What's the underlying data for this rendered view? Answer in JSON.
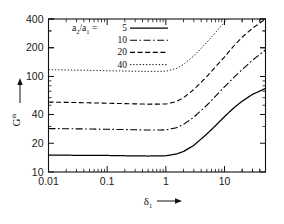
{
  "figure": {
    "background": "#ffffff",
    "line_color": "#000000"
  },
  "axes": {
    "x": {
      "label_main": "δ",
      "label_sub": "1",
      "arrow": "⟶",
      "scale": "log",
      "ticks": [
        "0.01",
        "0.1",
        "1",
        "10"
      ],
      "tick_values": [
        0.01,
        0.1,
        1,
        10
      ],
      "range": [
        0.01,
        50
      ]
    },
    "y": {
      "label_main": "G",
      "label_sup": "th",
      "arrow": "↑",
      "scale": "log",
      "ticks": [
        "400",
        "200",
        "100",
        "40",
        "20",
        "10"
      ],
      "tick_values": [
        400,
        200,
        100,
        40,
        20,
        10
      ],
      "range": [
        10,
        400
      ]
    }
  },
  "legend": {
    "title_num": "a",
    "title_num_sub": "2",
    "title_slash": "/",
    "title_den": "a",
    "title_den_sub": "1",
    "equals": "=",
    "entries": [
      {
        "label": "5",
        "style": "solid",
        "dash": "none"
      },
      {
        "label": "10",
        "style": "dash-dot",
        "dash": "7,2.5,1.6,2.5"
      },
      {
        "label": "20",
        "style": "dashed",
        "dash": "5,2.6"
      },
      {
        "label": "40",
        "style": "dotted",
        "dash": "1.3,1.9"
      }
    ]
  },
  "chart_data": {
    "type": "line",
    "title": "",
    "xlabel": "δ₁",
    "ylabel": "G^th",
    "xscale": "log",
    "yscale": "log",
    "xlim": [
      0.01,
      50
    ],
    "ylim": [
      10,
      400
    ],
    "grid": false,
    "legend_position": "top-left",
    "legend_title": "a₂/a₁",
    "x": [
      0.01,
      0.02,
      0.05,
      0.1,
      0.2,
      0.5,
      1,
      1.5,
      2,
      3,
      5,
      7,
      10,
      15,
      20,
      30,
      50
    ],
    "series": [
      {
        "name": "5",
        "style": "solid",
        "values": [
          15.0,
          15.0,
          14.9,
          14.9,
          14.8,
          14.7,
          14.8,
          15.4,
          16.4,
          19.0,
          25.0,
          30.5,
          38.0,
          48.0,
          55.0,
          65.0,
          75.0
        ]
      },
      {
        "name": "10",
        "style": "dash-dot",
        "values": [
          28.5,
          28.4,
          28.2,
          28.0,
          27.8,
          27.5,
          27.6,
          29.0,
          31.5,
          37.5,
          50.0,
          62.0,
          78.0,
          100.0,
          118.0,
          148.0,
          190.0
        ]
      },
      {
        "name": "20",
        "style": "dashed",
        "values": [
          54.0,
          53.6,
          53.0,
          52.5,
          52.0,
          51.3,
          51.5,
          54.5,
          60.0,
          73.0,
          100.0,
          126.0,
          160.0,
          215.0,
          258.0,
          320.0,
          400.0
        ]
      },
      {
        "name": "40",
        "style": "dotted",
        "values": [
          118.0,
          117.0,
          116.0,
          115.0,
          114.0,
          113.0,
          113.5,
          121.0,
          134.0,
          164.0,
          228.0,
          288.0,
          370.0,
          500.0,
          610.0,
          790.0,
          1050.0
        ]
      }
    ]
  }
}
